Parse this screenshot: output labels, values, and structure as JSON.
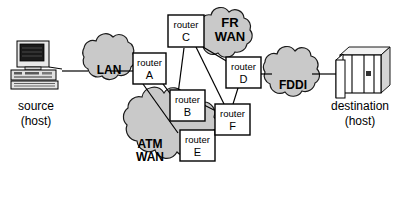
{
  "diagram": {
    "colors": {
      "cloud_fill": "#c9c9c9",
      "cloud_stroke": "#1a1a1a",
      "box_fill": "#ffffff",
      "line": "#000000",
      "text": "#000000",
      "background": "#ffffff"
    },
    "hosts": [
      {
        "id": "source",
        "icon": "desktop-computer-icon",
        "label_line1": "source",
        "label_line2": "(host)"
      },
      {
        "id": "destination",
        "icon": "server-stack-icon",
        "label_line1": "destination",
        "label_line2": "(host)"
      }
    ],
    "clouds": [
      {
        "id": "lan",
        "label_line1": "LAN",
        "label_line2": ""
      },
      {
        "id": "fr-wan",
        "label_line1": "FR",
        "label_line2": "WAN"
      },
      {
        "id": "atm-wan",
        "label_line1": "ATM",
        "label_line2": "WAN"
      },
      {
        "id": "fddi",
        "label_line1": "FDDI",
        "label_line2": ""
      }
    ],
    "routers": [
      {
        "id": "a",
        "label_line1": "router",
        "label_line2": "A"
      },
      {
        "id": "b",
        "label_line1": "router",
        "label_line2": "B"
      },
      {
        "id": "c",
        "label_line1": "router",
        "label_line2": "C"
      },
      {
        "id": "d",
        "label_line1": "router",
        "label_line2": "D"
      },
      {
        "id": "e",
        "label_line1": "router",
        "label_line2": "E"
      },
      {
        "id": "f",
        "label_line1": "router",
        "label_line2": "F"
      }
    ],
    "links": [
      {
        "from": "source",
        "to": "lan"
      },
      {
        "from": "lan",
        "to": "a"
      },
      {
        "from": "a",
        "to": "b"
      },
      {
        "from": "a",
        "to": "e"
      },
      {
        "from": "b",
        "to": "c"
      },
      {
        "from": "b",
        "to": "f"
      },
      {
        "from": "c",
        "to": "d"
      },
      {
        "from": "c",
        "to": "f"
      },
      {
        "from": "d",
        "to": "f"
      },
      {
        "from": "e",
        "to": "f"
      },
      {
        "from": "d",
        "to": "fddi"
      },
      {
        "from": "fddi",
        "to": "destination"
      }
    ]
  }
}
